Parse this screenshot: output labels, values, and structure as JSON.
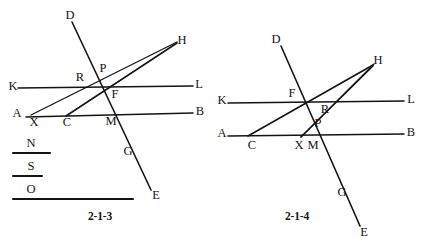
{
  "page": {
    "background_color": "#ffffff",
    "ink_color": "#141414",
    "width": 425,
    "height": 246
  },
  "figures": [
    {
      "id": "figure-2-1-3",
      "caption": "2-1-3",
      "caption_pos": {
        "x": 100,
        "y": 217
      },
      "lines": [
        {
          "name": "line-KL",
          "x1": 18,
          "y1": 88,
          "x2": 193,
          "y2": 86
        },
        {
          "name": "line-AB",
          "x1": 26,
          "y1": 117,
          "x2": 193,
          "y2": 113
        },
        {
          "name": "line-DE",
          "x1": 72,
          "y1": 22,
          "x2": 151,
          "y2": 190
        },
        {
          "name": "line-XH",
          "x1": 31,
          "y1": 115,
          "x2": 177,
          "y2": 42
        },
        {
          "name": "line-CH",
          "x1": 66,
          "y1": 116,
          "x2": 177,
          "y2": 43
        },
        {
          "name": "segment-N",
          "x1": 13,
          "y1": 153,
          "x2": 50,
          "y2": 153
        },
        {
          "name": "segment-S",
          "x1": 13,
          "y1": 176,
          "x2": 42,
          "y2": 176
        },
        {
          "name": "segment-O",
          "x1": 13,
          "y1": 199,
          "x2": 133,
          "y2": 199
        }
      ],
      "points": [
        {
          "name": "point-D",
          "label": "D",
          "x": 70,
          "y": 16
        },
        {
          "name": "point-H",
          "label": "H",
          "x": 182,
          "y": 41
        },
        {
          "name": "point-K",
          "label": "K",
          "x": 13,
          "y": 87
        },
        {
          "name": "point-L",
          "label": "L",
          "x": 199,
          "y": 85
        },
        {
          "name": "point-R",
          "label": "R",
          "x": 80,
          "y": 78
        },
        {
          "name": "point-P",
          "label": "P",
          "x": 103,
          "y": 69
        },
        {
          "name": "point-F",
          "label": "F",
          "x": 115,
          "y": 95
        },
        {
          "name": "point-A",
          "label": "A",
          "x": 17,
          "y": 114
        },
        {
          "name": "point-B",
          "label": "B",
          "x": 200,
          "y": 112
        },
        {
          "name": "point-X",
          "label": "X",
          "x": 34,
          "y": 123
        },
        {
          "name": "point-C",
          "label": "C",
          "x": 67,
          "y": 123
        },
        {
          "name": "point-M",
          "label": "M",
          "x": 111,
          "y": 122
        },
        {
          "name": "point-G",
          "label": "G",
          "x": 128,
          "y": 152
        },
        {
          "name": "point-E",
          "label": "E",
          "x": 156,
          "y": 196
        },
        {
          "name": "point-N",
          "label": "N",
          "x": 31,
          "y": 144
        },
        {
          "name": "point-S",
          "label": "S",
          "x": 31,
          "y": 167
        },
        {
          "name": "point-O",
          "label": "O",
          "x": 31,
          "y": 190
        }
      ]
    },
    {
      "id": "figure-2-1-4",
      "caption": "2-1-4",
      "caption_pos": {
        "x": 297,
        "y": 217
      },
      "lines": [
        {
          "name": "line-KL",
          "x1": 228,
          "y1": 103,
          "x2": 404,
          "y2": 101
        },
        {
          "name": "line-AB",
          "x1": 228,
          "y1": 136,
          "x2": 404,
          "y2": 134
        },
        {
          "name": "line-DE",
          "x1": 281,
          "y1": 46,
          "x2": 360,
          "y2": 226
        },
        {
          "name": "line-CH",
          "x1": 248,
          "y1": 136,
          "x2": 373,
          "y2": 65
        },
        {
          "name": "line-XH",
          "x1": 301,
          "y1": 137,
          "x2": 373,
          "y2": 66
        },
        {
          "name": "segment-XH-ext",
          "x1": 301,
          "y1": 137,
          "x2": 374,
          "y2": 64
        }
      ],
      "points": [
        {
          "name": "point-D",
          "label": "D",
          "x": 276,
          "y": 40
        },
        {
          "name": "point-H",
          "label": "H",
          "x": 378,
          "y": 61
        },
        {
          "name": "point-K",
          "label": "K",
          "x": 222,
          "y": 101
        },
        {
          "name": "point-L",
          "label": "L",
          "x": 411,
          "y": 100
        },
        {
          "name": "point-F",
          "label": "F",
          "x": 292,
          "y": 94
        },
        {
          "name": "point-R",
          "label": "R",
          "x": 325,
          "y": 110
        },
        {
          "name": "point-P",
          "label": "P",
          "x": 318,
          "y": 124
        },
        {
          "name": "point-A",
          "label": "A",
          "x": 222,
          "y": 134
        },
        {
          "name": "point-B",
          "label": "B",
          "x": 411,
          "y": 133
        },
        {
          "name": "point-C",
          "label": "C",
          "x": 252,
          "y": 146
        },
        {
          "name": "point-X",
          "label": "X",
          "x": 299,
          "y": 146
        },
        {
          "name": "point-M",
          "label": "M",
          "x": 313,
          "y": 146
        },
        {
          "name": "point-G",
          "label": "G",
          "x": 342,
          "y": 193
        },
        {
          "name": "point-E",
          "label": "E",
          "x": 364,
          "y": 233
        }
      ]
    }
  ]
}
